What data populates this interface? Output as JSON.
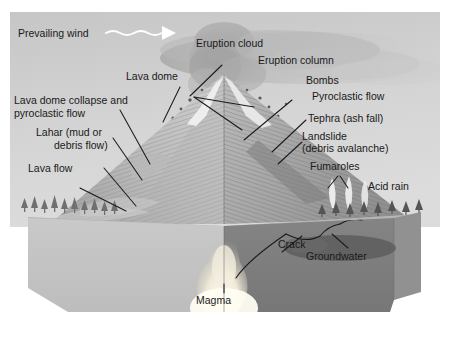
{
  "figure": {
    "type": "diagram"
  },
  "colors": {
    "sky_top": "#c9c9c9",
    "sky_bottom": "#d8d8d8",
    "ash_cloud": "#b4b4b4",
    "cone_light": "#d2d2d2",
    "cone_dark": "#8e8e8e",
    "snow": "#f2f2f2",
    "ground_left_face": "#c3c3c3",
    "ground_right_face": "#7d7d7d",
    "ground_side_face": "#9a9a9a",
    "magma": "#f7f3e8",
    "groundwater": "#5f5f5f",
    "label_text": "#1a1a1a",
    "leader_line": "#1b1b1b",
    "wind_arrow": "#ffffff",
    "tree": "#6b6b6b"
  },
  "labels": {
    "prevailing_wind": "Prevailing wind",
    "eruption_cloud": "Eruption cloud",
    "eruption_column": "Eruption column",
    "bombs": "Bombs",
    "pyroclastic_flow": "Pyroclastic flow",
    "tephra": "Tephra (ash fall)",
    "landslide_line1": "Landslide",
    "landslide_line2": "(debris avalanche)",
    "fumaroles": "Fumaroles",
    "acid_rain": "Acid rain",
    "lava_dome": "Lava dome",
    "dome_collapse_line1": "Lava dome collapse and",
    "dome_collapse_line2": "pyroclastic flow",
    "lahar_line1": "Lahar (mud or",
    "lahar_line2": "debris flow)",
    "lava_flow": "Lava flow",
    "crack": "Crack",
    "groundwater": "Groundwater",
    "magma": "Magma"
  },
  "icons": {
    "wind_arrow": "wavy-arrow-right-icon"
  }
}
